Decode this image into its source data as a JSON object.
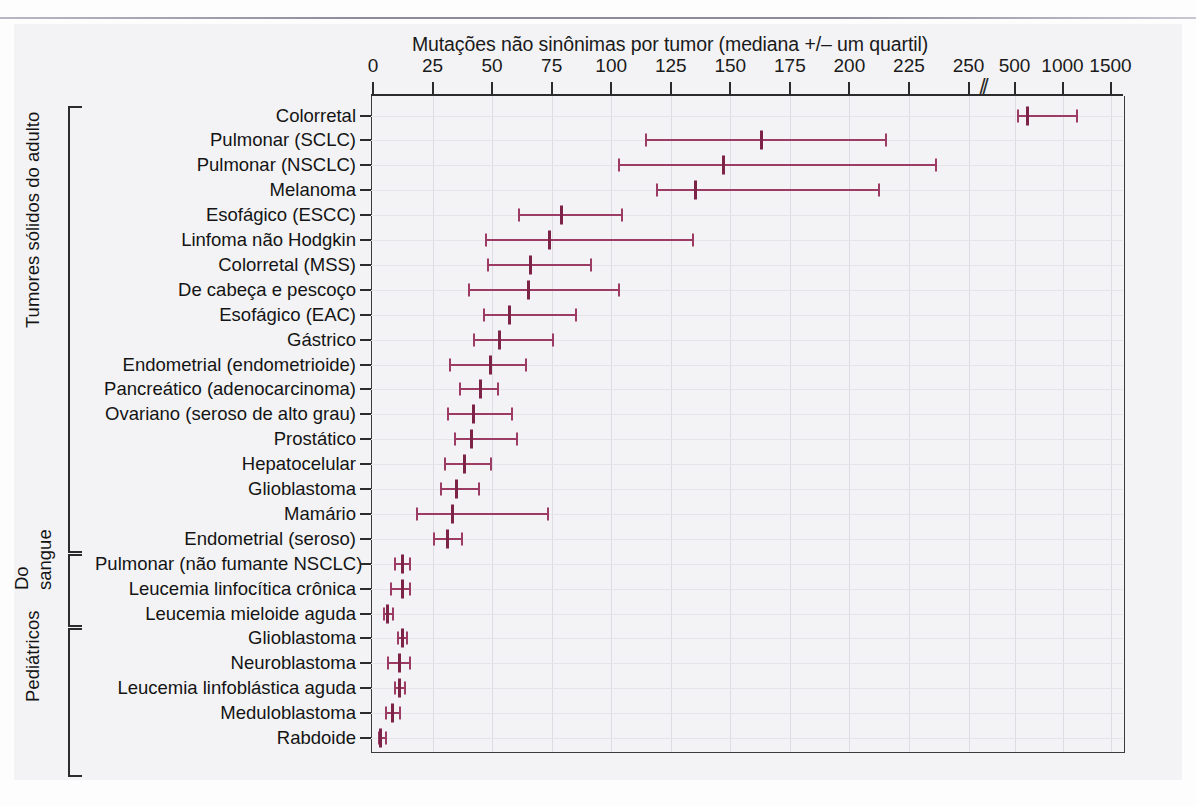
{
  "chart_data": {
    "type": "scatter",
    "title": "Mutações não sinônimas por tumor (mediana +/– um quartil)",
    "xlabel": "Mutações não sinônimas por tumor (mediana +/– um quartil)",
    "ylabel": "",
    "orientation": "horizontal",
    "grid": true,
    "legend": false,
    "axis_break": {
      "after": 250,
      "note": "//"
    },
    "xticks": [
      0,
      25,
      50,
      75,
      100,
      125,
      150,
      175,
      200,
      225,
      250,
      500,
      1000,
      1500
    ],
    "xtick_labels": [
      "0",
      "25",
      "50",
      "75",
      "100",
      "125",
      "150",
      "175",
      "200",
      "225",
      "250",
      "500",
      "1000",
      "1500"
    ],
    "xlim": [
      0,
      1500
    ],
    "marker_color": "#9c3b63",
    "median_color": "#7d2347",
    "groups": [
      {
        "name": "Tumores sólidos do adulto",
        "label": "Tumores sólidos do adulto",
        "first_row": 0,
        "last_row": 17
      },
      {
        "name": "Do sangue",
        "label": "Do sangue",
        "label_lines": [
          "Do",
          "sangue"
        ],
        "first_row": 18,
        "last_row": 20
      },
      {
        "name": "Pediátricos",
        "label": "Pediátricos",
        "first_row": 21,
        "last_row": 26
      }
    ],
    "categories": [
      "Colorretal",
      "Pulmonar (SCLC)",
      "Pulmonar (NSCLC)",
      "Melanoma",
      "Esofágico (ESCC)",
      "Linfoma não Hodgkin",
      "Colorretal (MSS)",
      "De cabeça e pescoço",
      "Esofágico (EAC)",
      "Gástrico",
      "Endometrial (endometrioide)",
      "Pancreático (adenocarcinoma)",
      "Ovariano (seroso de alto grau)",
      "Prostático",
      "Hepatocelular",
      "Glioblastoma",
      "Mamário",
      "Endometrial (seroso)",
      "Pulmonar (não fumante NSCLC)",
      "Leucemia linfocítica crônica",
      "Leucemia mieloide aguda",
      "Glioblastoma",
      "Neuroblastoma",
      "Leucemia linfoblástica aguda",
      "Meduloblastoma",
      "Rabdoide"
    ],
    "rows": [
      {
        "label": "Colorretal",
        "group": 0,
        "lower": 525,
        "median": 635,
        "upper": 1140
      },
      {
        "label": "Pulmonar (SCLC)",
        "group": 0,
        "lower": 114,
        "median": 163,
        "upper": 215
      },
      {
        "label": "Pulmonar (NSCLC)",
        "group": 0,
        "lower": 103,
        "median": 147,
        "upper": 236
      },
      {
        "label": "Melanoma",
        "group": 0,
        "lower": 119,
        "median": 135,
        "upper": 212
      },
      {
        "label": "Esofágico (ESCC)",
        "group": 0,
        "lower": 61,
        "median": 79,
        "upper": 104
      },
      {
        "label": "Linfoma não Hodgkin",
        "group": 0,
        "lower": 47,
        "median": 74,
        "upper": 134
      },
      {
        "label": "Colorretal (MSS)",
        "group": 0,
        "lower": 48,
        "median": 66,
        "upper": 91
      },
      {
        "label": "De cabeça e pescoço",
        "group": 0,
        "lower": 40,
        "median": 65,
        "upper": 103
      },
      {
        "label": "Esofágico (EAC)",
        "group": 0,
        "lower": 46,
        "median": 57,
        "upper": 85
      },
      {
        "label": "Gástrico",
        "group": 0,
        "lower": 42,
        "median": 53,
        "upper": 75
      },
      {
        "label": "Endometrial (endometrioide)",
        "group": 0,
        "lower": 32,
        "median": 49,
        "upper": 64
      },
      {
        "label": "Pancreático (adenocarcinoma)",
        "group": 0,
        "lower": 36,
        "median": 45,
        "upper": 52
      },
      {
        "label": "Ovariano (seroso de alto grau)",
        "group": 0,
        "lower": 31,
        "median": 42,
        "upper": 58
      },
      {
        "label": "Prostático",
        "group": 0,
        "lower": 34,
        "median": 41,
        "upper": 60
      },
      {
        "label": "Hepatocelular",
        "group": 0,
        "lower": 30,
        "median": 38,
        "upper": 49
      },
      {
        "label": "Glioblastoma",
        "group": 0,
        "lower": 28,
        "median": 35,
        "upper": 44
      },
      {
        "label": "Mamário",
        "group": 0,
        "lower": 18,
        "median": 33,
        "upper": 73
      },
      {
        "label": "Endometrial (seroso)",
        "group": 0,
        "lower": 25,
        "median": 31,
        "upper": 37
      },
      {
        "label": "Pulmonar (não fumante NSCLC)",
        "group": 1,
        "lower": 9,
        "median": 12,
        "upper": 15
      },
      {
        "label": "Leucemia linfocítica crônica",
        "group": 1,
        "lower": 7,
        "median": 12,
        "upper": 15
      },
      {
        "label": "Leucemia mieloide aguda",
        "group": 1,
        "lower": 4,
        "median": 6,
        "upper": 8
      },
      {
        "label": "Glioblastoma",
        "group": 2,
        "lower": 10,
        "median": 12,
        "upper": 14
      },
      {
        "label": "Neuroblastoma",
        "group": 2,
        "lower": 6,
        "median": 11,
        "upper": 15
      },
      {
        "label": "Leucemia linfoblástica aguda",
        "group": 2,
        "lower": 9,
        "median": 11,
        "upper": 13
      },
      {
        "label": "Meduloblastoma",
        "group": 2,
        "lower": 5,
        "median": 8,
        "upper": 11
      },
      {
        "label": "Rabdoide",
        "group": 2,
        "lower": 2,
        "median": 3,
        "upper": 5
      }
    ]
  },
  "axis": {
    "title": "Mutações não sinônimas por tumor (mediana +/– um quartil)",
    "break_glyph": "//"
  }
}
